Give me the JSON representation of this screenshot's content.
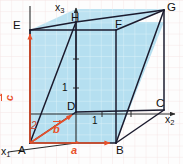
{
  "figure": {
    "colors": {
      "face_fill": "#b5dff0",
      "edge": "#1b1b2e",
      "vector": "#e8502a",
      "axis": "#2a2a2a",
      "grid_inside": "#ffffff",
      "grid_outside": "#f0dede",
      "background": "#fdfdfd"
    },
    "axes": [
      {
        "name": "x1",
        "label": "x",
        "sub": "1"
      },
      {
        "name": "x2",
        "label": "x",
        "sub": "2"
      },
      {
        "name": "x3",
        "label": "x",
        "sub": "3"
      }
    ],
    "vertices": [
      {
        "name": "A",
        "label": "A"
      },
      {
        "name": "B",
        "label": "B"
      },
      {
        "name": "C",
        "label": "C"
      },
      {
        "name": "D",
        "label": "D"
      },
      {
        "name": "E",
        "label": "E"
      },
      {
        "name": "F",
        "label": "F"
      },
      {
        "name": "G",
        "label": "G"
      },
      {
        "name": "H",
        "label": "H"
      }
    ],
    "vectors": [
      {
        "name": "a",
        "label": "a"
      },
      {
        "name": "b",
        "label": "b"
      },
      {
        "name": "c",
        "label": "c"
      }
    ],
    "ticks": [
      {
        "name": "tick-x2-1",
        "label": "1"
      },
      {
        "name": "tick-x3-1",
        "label": "1"
      },
      {
        "name": "tick-x1-2",
        "label": "2"
      }
    ]
  }
}
